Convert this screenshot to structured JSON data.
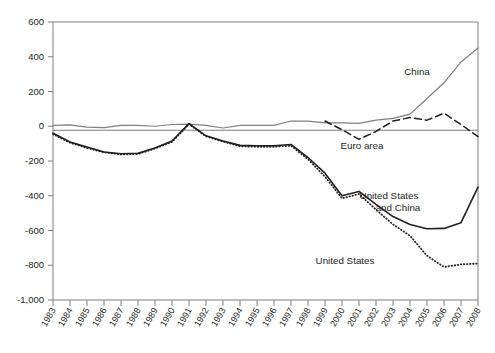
{
  "chart_data": {
    "type": "line",
    "title": "",
    "subtitle": "",
    "xlabel": "",
    "ylabel": "",
    "grid": false,
    "legend_position": "inline-annotations",
    "x": [
      1983,
      1984,
      1985,
      1986,
      1987,
      1988,
      1989,
      1990,
      1991,
      1992,
      1993,
      1994,
      1995,
      1996,
      1997,
      1998,
      1999,
      2000,
      2001,
      2002,
      2003,
      2004,
      2005,
      2006,
      2007,
      2008
    ],
    "xtick_labels": [
      "1983",
      "1984",
      "1985",
      "1986",
      "1987",
      "1988",
      "1989",
      "1990",
      "1991",
      "1992",
      "1993",
      "1994",
      "1995",
      "1996",
      "1997",
      "1998",
      "1999",
      "2000",
      "2001",
      "2002",
      "2003",
      "2004",
      "2005",
      "2006",
      "2007",
      "2008"
    ],
    "ytick_labels": [
      "600",
      "400",
      "200",
      "0",
      "-200",
      "-400",
      "-600",
      "-800",
      "-1,000"
    ],
    "ytick_values": [
      600,
      400,
      200,
      0,
      -200,
      -400,
      -600,
      -800,
      -1000
    ],
    "ylim": [
      -1000,
      600
    ],
    "xlim": [
      1983,
      2008
    ],
    "series": [
      {
        "name": "China",
        "label": "China",
        "style": "solid",
        "color": "#808080",
        "width": 1.2,
        "values": [
          5,
          8,
          -5,
          -8,
          5,
          5,
          0,
          10,
          12,
          5,
          -10,
          5,
          5,
          5,
          30,
          30,
          20,
          20,
          17,
          35,
          45,
          70,
          160,
          250,
          370,
          450
        ]
      },
      {
        "name": "Euro area",
        "label": "Euro area",
        "style": "dashed",
        "color": "#231f20",
        "width": 1.5,
        "values": [
          null,
          null,
          null,
          null,
          null,
          null,
          null,
          null,
          null,
          null,
          null,
          null,
          null,
          null,
          null,
          null,
          30,
          -20,
          -75,
          -30,
          30,
          50,
          35,
          75,
          10,
          -60
        ]
      },
      {
        "name": "United States and China",
        "label": "United States and China",
        "style": "solid",
        "color": "#231f20",
        "width": 1.6,
        "values": [
          -40,
          -90,
          -120,
          -148,
          -158,
          -155,
          -125,
          -85,
          15,
          -55,
          -85,
          -110,
          -112,
          -112,
          -105,
          -180,
          -270,
          -400,
          -375,
          -450,
          -520,
          -565,
          -590,
          -588,
          -555,
          -350
        ]
      },
      {
        "name": "United States",
        "label": "United States",
        "style": "dotted",
        "color": "#231f20",
        "width": 1.8,
        "values": [
          -45,
          -95,
          -125,
          -150,
          -162,
          -160,
          -128,
          -90,
          12,
          -58,
          -88,
          -115,
          -118,
          -118,
          -112,
          -190,
          -290,
          -415,
          -390,
          -480,
          -565,
          -630,
          -745,
          -810,
          -795,
          -790
        ]
      }
    ],
    "annotations": [
      {
        "name": "china-label",
        "text": "China",
        "x": 417,
        "y": 75
      },
      {
        "name": "euro-area-label",
        "text": "Euro area",
        "x": 362,
        "y": 149
      },
      {
        "name": "us-and-china-label-line1",
        "text": "United States",
        "x": 389,
        "y": 199
      },
      {
        "name": "us-and-china-label-line2",
        "text": "and China",
        "x": 398,
        "y": 211
      },
      {
        "name": "united-states-label",
        "text": "United States",
        "x": 345,
        "y": 264
      }
    ]
  }
}
